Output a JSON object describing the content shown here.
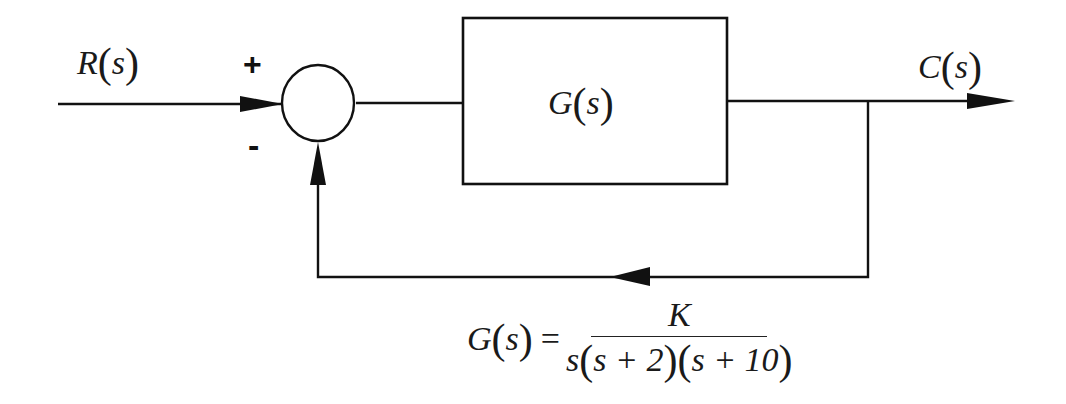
{
  "diagram": {
    "type": "block-diagram",
    "input": {
      "label_main": "R",
      "label_arg": "s"
    },
    "output": {
      "label_main": "C",
      "label_arg": "s"
    },
    "summing_junction": {
      "plus_sign": "+",
      "minus_sign": "-"
    },
    "forward_block": {
      "label_main": "G",
      "label_arg": "s"
    },
    "transfer_function": {
      "lhs_main": "G",
      "lhs_arg": "s",
      "equals": "=",
      "numerator": "K",
      "denominator_parts": {
        "s": "s",
        "f1": "s + 2",
        "f2": "s + 10"
      }
    },
    "colors": {
      "line": "#111111",
      "background": "#ffffff"
    }
  }
}
